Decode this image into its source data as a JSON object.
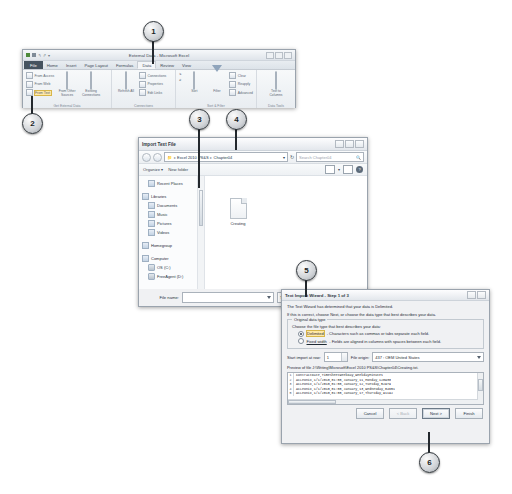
{
  "excel": {
    "title": "External Data - Microsoft Excel",
    "quick_access": [
      "save-icon",
      "undo-icon",
      "redo-icon",
      "customize-icon"
    ],
    "tabs": [
      "File",
      "Home",
      "Insert",
      "Page Layout",
      "Formulas",
      "Data",
      "Review",
      "View"
    ],
    "active_tab": "Data",
    "groups": [
      {
        "label": "Get External Data",
        "small_buttons": [
          "From Access",
          "From Web",
          "From Text"
        ],
        "big_buttons": [
          "From Other Sources",
          "Existing Connections"
        ]
      },
      {
        "label": "Connections",
        "big_buttons": [
          "Refresh All"
        ],
        "small_buttons": [
          "Connections",
          "Properties",
          "Edit Links"
        ]
      },
      {
        "label": "Sort & Filter",
        "big_buttons": [
          "Sort",
          "Filter"
        ],
        "small_buttons": [
          "Clear",
          "Reapply",
          "Advanced"
        ]
      },
      {
        "label": "Data Tools",
        "big_buttons": [
          "Text to Columns"
        ]
      }
    ],
    "highlight": "From Text"
  },
  "import_dialog": {
    "title": "Import Text File",
    "breadcrumb": [
      "Excel 2010 PS&S",
      "Chapter04"
    ],
    "search_placeholder": "Search Chapter04",
    "toolbar": [
      "Organize",
      "New folder"
    ],
    "nav_items": [
      {
        "label": "Recent Places",
        "icon": "recent-icon",
        "level": 1
      },
      {
        "label": "Libraries",
        "icon": "library-icon",
        "level": 0
      },
      {
        "label": "Documents",
        "icon": "documents-icon",
        "level": 1
      },
      {
        "label": "Music",
        "icon": "music-icon",
        "level": 1
      },
      {
        "label": "Pictures",
        "icon": "pictures-icon",
        "level": 1
      },
      {
        "label": "Videos",
        "icon": "videos-icon",
        "level": 1
      },
      {
        "label": "Homegroup",
        "icon": "homegroup-icon",
        "level": 0
      },
      {
        "label": "Computer",
        "icon": "computer-icon",
        "level": 0
      },
      {
        "label": "OS (C:)",
        "icon": "disk-icon",
        "level": 1
      },
      {
        "label": "FreeAgent (D:)",
        "icon": "disk-icon",
        "level": 1
      }
    ],
    "files": [
      {
        "name": "Creating",
        "icon": "text-file-icon"
      }
    ],
    "file_name_label": "File name:",
    "file_name_value": "",
    "file_type_value": "Text Files",
    "tools_label": "Tools",
    "open_label": "Open",
    "cancel_label": "Cancel"
  },
  "wizard": {
    "title": "Text Import Wizard - Step 1 of 3",
    "line1": "The Text Wizard has determined that your data is Delimited.",
    "line2": "If this is correct, choose Next, or choose the data type that best describes your data.",
    "group_legend": "Original data type",
    "group_prompt": "Choose the file type that best describes your data:",
    "options": [
      {
        "label": "Delimited",
        "desc": "- Characters such as commas or tabs separate each field.",
        "selected": true
      },
      {
        "label": "Fixed width",
        "desc": "- Fields are aligned in columns with spaces between each field.",
        "selected": false
      }
    ],
    "start_row_label": "Start import at row:",
    "start_row_value": "1",
    "file_origin_label": "File origin:",
    "file_origin_value": "437 : OEM United States",
    "preview_label": "Preview of file J:\\Writing\\Microsoft\\Excel 2010 PS&S\\Chapter04\\Creating.txt.",
    "preview_rows": [
      {
        "n": "1",
        "text": "ContractDate,TimeSheetWeekDay,WeekdayMinutes"
      },
      {
        "n": "2",
        "text": "AcLeonix,1/1/2010,01:00,January,11,Monday,120930"
      },
      {
        "n": "3",
        "text": "AcLeonix,1/1/2010,01:00,January,12,Tuesday,52979"
      },
      {
        "n": "4",
        "text": "AcLeonix,1/1/2010,01:00,January,13,Wednesday,84651"
      },
      {
        "n": "5",
        "text": "AcLeonix,1/1/2010,01:00,January,17,Thursday,91192"
      }
    ],
    "buttons": [
      {
        "label": "Cancel",
        "state": "normal"
      },
      {
        "label": "< Back",
        "state": "disabled"
      },
      {
        "label": "Next >",
        "state": "default"
      },
      {
        "label": "Finish",
        "state": "normal"
      }
    ]
  },
  "callouts": [
    {
      "number": "1"
    },
    {
      "number": "2"
    },
    {
      "number": "3"
    },
    {
      "number": "4"
    },
    {
      "number": "5"
    },
    {
      "number": "6"
    }
  ]
}
